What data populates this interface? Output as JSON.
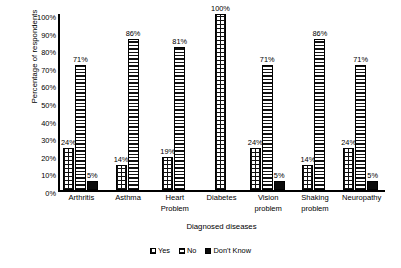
{
  "chart_data": {
    "type": "bar",
    "title": "",
    "subtitle": "",
    "xlabel": "Diagnosed diseases",
    "ylabel": "Percentage of respondents",
    "ylim": [
      0,
      100
    ],
    "y_tick_labels": [
      "100%",
      "90%",
      "80%",
      "70%",
      "60%",
      "50%",
      "40%",
      "30%",
      "20%",
      "10%",
      "0%"
    ],
    "y_tick_values": [
      100,
      90,
      80,
      70,
      60,
      50,
      40,
      30,
      20,
      10,
      0
    ],
    "grid": false,
    "legend_position": "bottom",
    "categories": [
      "Arthritis",
      "Asthma",
      "Heart Problem",
      "Diabetes",
      "Vision problem",
      "Shaking problem",
      "Neuropathy"
    ],
    "category_lines": [
      [
        "Arthritis"
      ],
      [
        "Asthma"
      ],
      [
        "Heart",
        "Problem"
      ],
      [
        "Diabetes"
      ],
      [
        "Vision",
        "problem"
      ],
      [
        "Shaking",
        "problem"
      ],
      [
        "Neuropathy"
      ]
    ],
    "series": [
      {
        "name": "Yes",
        "pattern": "checkered",
        "color": "#111111",
        "values": [
          24,
          14,
          19,
          100,
          24,
          14,
          24
        ],
        "data_labels": [
          "24%",
          "14%",
          "19%",
          "100%",
          "24%",
          "14%",
          "24%"
        ]
      },
      {
        "name": "No",
        "pattern": "horizontal-lines",
        "color": "#111111",
        "values": [
          71,
          86,
          81,
          null,
          71,
          86,
          71
        ],
        "data_labels": [
          "71%",
          "86%",
          "81%",
          "",
          "71%",
          "86%",
          "71%"
        ]
      },
      {
        "name": "Don't Know",
        "pattern": "solid",
        "color": "#0a0a0a",
        "values": [
          5,
          null,
          null,
          null,
          5,
          null,
          5
        ],
        "data_labels": [
          "5%",
          "",
          "",
          "",
          "5%",
          "",
          "5%"
        ]
      }
    ],
    "legend_entries": [
      "Yes",
      "No",
      "Don't Know"
    ]
  }
}
